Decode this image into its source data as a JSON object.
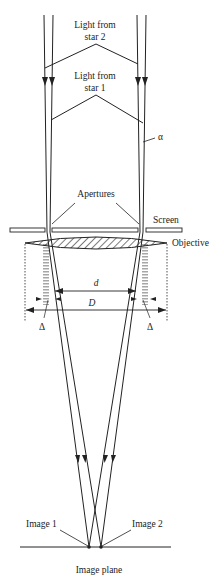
{
  "diagram": {
    "labels": {
      "star2": [
        "Light from",
        "star 2"
      ],
      "star1": [
        "Light from",
        "star 1"
      ],
      "alpha": "α",
      "apertures": "Apertures",
      "screen": "Screen",
      "objective": "Objective",
      "d": "d",
      "D": "D",
      "delta_left": "Δ",
      "delta_right": "Δ",
      "image1": "Image 1",
      "image2": "Image 2",
      "image_plane": "Image plane"
    },
    "colors": {
      "line": "#222222",
      "background": "#ffffff"
    }
  }
}
